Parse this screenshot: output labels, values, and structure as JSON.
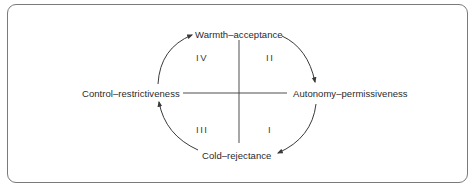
{
  "diagram": {
    "poles": {
      "top": "Warmth–acceptance",
      "bottom": "Cold–rejectance",
      "left": "Control–restrictiveness",
      "right": "Autonomy–permissiveness"
    },
    "quadrants": {
      "top_left": "IV",
      "top_right": "II",
      "bottom_left": "III",
      "bottom_right": "I"
    },
    "cycle_direction": "clockwise",
    "colors": {
      "line": "#3a3a3a",
      "frame": "#7a7a7a",
      "text": "#2a2a2a"
    }
  }
}
